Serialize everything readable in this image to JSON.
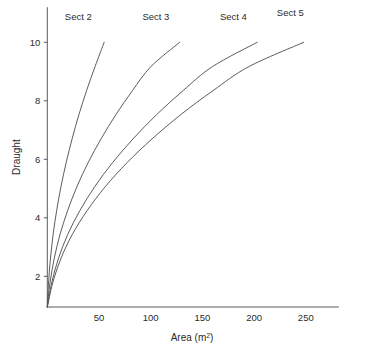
{
  "chart_data": {
    "type": "line",
    "title": "",
    "xlabel": "Area (m2)",
    "xlabel_base": "Area (m",
    "xlabel_sup": "2",
    "xlabel_close": ")",
    "ylabel": "Draught",
    "xlim": [
      0,
      282
    ],
    "ylim": [
      0,
      11.2
    ],
    "grid": false,
    "legend_position": "inline-curve-end-labels",
    "xticks": [
      50,
      100,
      150,
      200,
      250
    ],
    "xtick_labels": [
      "50",
      "100",
      "150",
      "200",
      "250"
    ],
    "yticks": [
      2,
      4,
      6,
      8,
      10
    ],
    "ytick_labels": [
      "2",
      "4",
      "6",
      "8",
      "10"
    ],
    "series": [
      {
        "name": "Sect 2",
        "label": "Sect 2",
        "color": "#535353",
        "label_x": 30,
        "label_y": 10.75,
        "x": [
          0.0,
          1.2,
          3.0,
          5.6,
          9.0,
          13.2,
          18.2,
          24.0,
          30.6,
          38.0,
          46.2,
          55.0
        ],
        "y": [
          0.95,
          1.77,
          2.59,
          3.42,
          4.24,
          5.06,
          5.88,
          6.7,
          7.53,
          8.35,
          9.17,
          10.0
        ]
      },
      {
        "name": "Sect 3",
        "label": "Sect 3",
        "color": "#535353",
        "label_x": 105,
        "label_y": 10.75,
        "x": [
          0.0,
          2.6,
          6.6,
          12.2,
          19.6,
          28.6,
          39.4,
          52.0,
          66.4,
          82.4,
          100.2,
          128.0
        ],
        "y": [
          0.95,
          1.77,
          2.59,
          3.42,
          4.24,
          5.06,
          5.88,
          6.7,
          7.53,
          8.35,
          9.17,
          10.0
        ]
      },
      {
        "name": "Sect 4",
        "label": "Sect 4",
        "color": "#535353",
        "label_x": 180,
        "label_y": 10.75,
        "x": [
          0.0,
          4.2,
          10.6,
          19.6,
          31.4,
          45.8,
          63.0,
          83.0,
          105.8,
          131.4,
          159.8,
          203.0
        ],
        "y": [
          0.95,
          1.77,
          2.59,
          3.42,
          4.24,
          5.06,
          5.88,
          6.7,
          7.53,
          8.35,
          9.17,
          10.0
        ]
      },
      {
        "name": "Sect 5",
        "label": "Sect 5",
        "color": "#535353",
        "label_x": 235,
        "label_y": 10.9,
        "x": [
          0.0,
          5.2,
          13.0,
          24.0,
          38.4,
          56.0,
          77.0,
          101.4,
          129.2,
          160.4,
          195.0,
          248.0
        ],
        "y": [
          0.95,
          1.77,
          2.59,
          3.42,
          4.24,
          5.06,
          5.88,
          6.7,
          7.53,
          8.35,
          9.17,
          10.0
        ]
      }
    ]
  }
}
